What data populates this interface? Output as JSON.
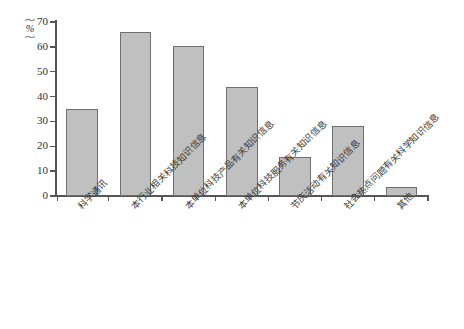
{
  "chart_data": {
    "type": "bar",
    "title": "",
    "subtitle": "",
    "xlabel": "",
    "ylabel": "(%)",
    "ylim": [
      0,
      70
    ],
    "ytick_labels": [
      "0",
      "10",
      "20",
      "30",
      "40",
      "50",
      "60",
      "70"
    ],
    "ytick_values": [
      0,
      10,
      20,
      30,
      40,
      50,
      60,
      70
    ],
    "grid": false,
    "legend": false,
    "legend_position": "none",
    "categories": [
      "科学通讯",
      "本行业相关科技知识信息",
      "本单位科技产品有关知识信息",
      "本单位科技服务有关知识信息",
      "节庆活动有关知识信息",
      "社会热点问题有关科学知识信息",
      "其他"
    ],
    "values": [
      35,
      66,
      60.5,
      44,
      15.5,
      28,
      3.5
    ],
    "bar_color": "#c0c0c0",
    "bar_edge_color": "#6f6f6f",
    "axis_color": "#555555",
    "background_color": "#ffffff"
  }
}
